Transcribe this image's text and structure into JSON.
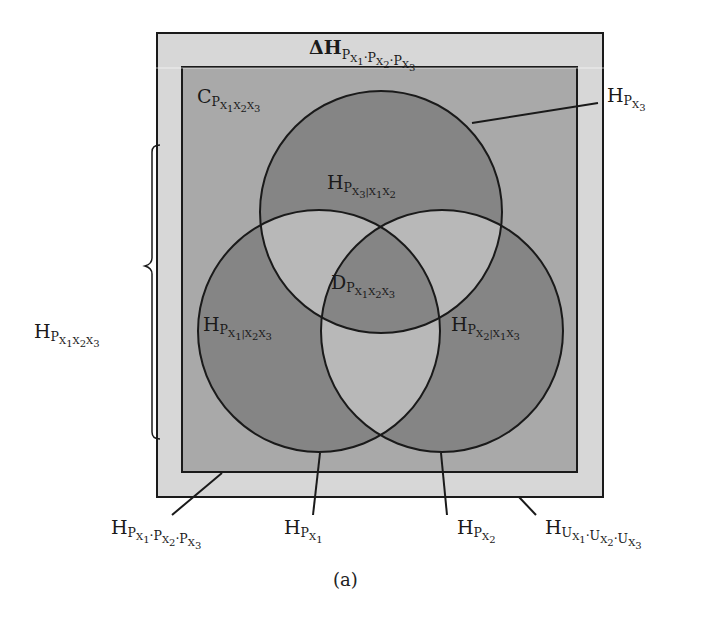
{
  "figure": {
    "caption": "(a)",
    "colors": {
      "outer_band": "#d7d7d7",
      "inner_rect": "#a9a9a9",
      "circle_dark": "#858585",
      "pair_overlap": "#b8b8b8",
      "stroke": "#1a1a1a"
    }
  },
  "labels": {
    "delta_h": {
      "main": "ΔH",
      "sub": "P",
      "sub_parts": [
        "X",
        "1",
        "·P",
        "X",
        "2",
        "·P",
        "X",
        "3"
      ]
    },
    "c_p": {
      "main": "C",
      "sub": "P",
      "sub_parts": [
        "X",
        "1",
        "X",
        "2",
        "X",
        "3"
      ]
    },
    "h_px3": {
      "main": "H",
      "sub": "P",
      "sub_parts": [
        "X",
        "3"
      ]
    },
    "h_px3_given": {
      "main": "H",
      "sub": "P",
      "sub_parts": [
        "X",
        "3",
        "|X",
        "1",
        "X",
        "2"
      ]
    },
    "d_p": {
      "main": "D",
      "sub": "P",
      "sub_parts": [
        "X",
        "1",
        "X",
        "2",
        "X",
        "3"
      ]
    },
    "h_px1_given": {
      "main": "H",
      "sub": "P",
      "sub_parts": [
        "X",
        "1",
        "|X",
        "2",
        "X",
        "3"
      ]
    },
    "h_px2_given": {
      "main": "H",
      "sub": "P",
      "sub_parts": [
        "X",
        "2",
        "|X",
        "1",
        "X",
        "3"
      ]
    },
    "h_joint": {
      "main": "H",
      "sub": "P",
      "sub_parts": [
        "X",
        "1",
        "X",
        "2",
        "X",
        "3"
      ]
    },
    "h_product": {
      "main": "H",
      "sub": "P",
      "sub_parts": [
        "X",
        "1",
        "·P",
        "X",
        "2",
        "·P",
        "X",
        "3"
      ]
    },
    "h_px1": {
      "main": "H",
      "sub": "P",
      "sub_parts": [
        "X",
        "1"
      ]
    },
    "h_px2": {
      "main": "H",
      "sub": "P",
      "sub_parts": [
        "X",
        "2"
      ]
    },
    "h_uniform": {
      "main": "H",
      "sub": "U",
      "sub_parts": [
        "X",
        "1",
        "·U",
        "X",
        "2",
        "·U",
        "X",
        "3"
      ]
    }
  }
}
